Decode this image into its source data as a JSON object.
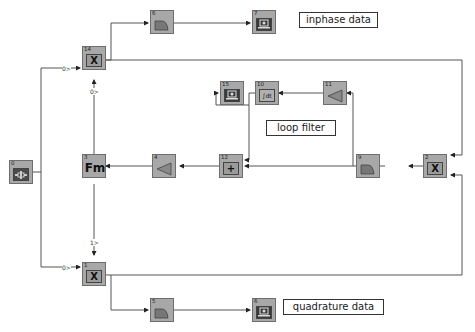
{
  "diagram": {
    "blocks": [
      {
        "id": "0",
        "type": "signal-source"
      },
      {
        "id": "1",
        "type": "multiplier",
        "symbol": "X"
      },
      {
        "id": "2",
        "type": "multiplier",
        "symbol": "X"
      },
      {
        "id": "3",
        "type": "fm-modulator",
        "symbol": "Fm"
      },
      {
        "id": "4",
        "type": "gain"
      },
      {
        "id": "5",
        "type": "lowpass-filter"
      },
      {
        "id": "6",
        "type": "scope-sink"
      },
      {
        "id": "7",
        "type": "lowpass-filter"
      },
      {
        "id": "8",
        "type": "scope-sink"
      },
      {
        "id": "9",
        "type": "lowpass-filter"
      },
      {
        "id": "10",
        "type": "integrator",
        "symbol": "∫dt"
      },
      {
        "id": "11",
        "type": "gain"
      },
      {
        "id": "12",
        "type": "adder",
        "symbol": "+"
      },
      {
        "id": "14",
        "type": "multiplier",
        "symbol": "X"
      },
      {
        "id": "15",
        "type": "scope-sink"
      }
    ],
    "annotations": {
      "inphase": "inphase data",
      "loop": "loop filter",
      "quadrature": "quadrature data"
    },
    "port_labels": {
      "b14_in_left": "0>",
      "b14_in_bottom": "0>",
      "b1_in_left": "0>",
      "b1_in_top": "1>"
    },
    "colors": {
      "block_fill": "#a8a8a8",
      "block_border": "#6e6e6e",
      "wire": "#555555",
      "background": "#ffffff"
    }
  }
}
